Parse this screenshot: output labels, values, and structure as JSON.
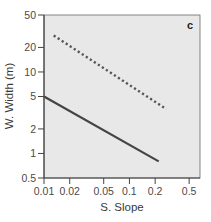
{
  "chart_data": {
    "type": "line",
    "title": "",
    "panel_label": "c",
    "xlabel": "S. Slope",
    "ylabel": "W. Width (m)",
    "xscale": "log",
    "yscale": "log",
    "xlim": [
      0.01,
      0.67
    ],
    "ylim": [
      0.5,
      50
    ],
    "xticks": [
      0.01,
      0.02,
      0.05,
      0.1,
      0.2,
      0.5
    ],
    "xtick_labels": [
      "0.01",
      "0.02",
      "0.05",
      "0.1",
      "0.2",
      "0.5"
    ],
    "yticks": [
      0.5,
      1,
      2,
      5,
      10,
      20,
      50
    ],
    "ytick_labels": [
      "0.5",
      "1",
      "2",
      "5",
      "10",
      "20",
      "50"
    ],
    "grid": false,
    "legend": null,
    "background_color": "#e8e8e8",
    "series": [
      {
        "name": "dotted",
        "style": "dotted",
        "color": "#555555",
        "x": [
          0.013,
          0.27
        ],
        "y": [
          28,
          3.5
        ]
      },
      {
        "name": "solid",
        "style": "solid",
        "color": "#444444",
        "x": [
          0.01,
          0.22
        ],
        "y": [
          5,
          0.8
        ]
      }
    ]
  }
}
